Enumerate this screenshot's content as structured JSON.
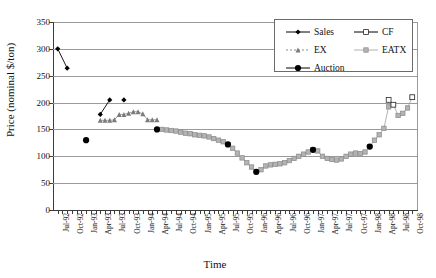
{
  "axes": {
    "ylabel": "Price (nominal $/ton)",
    "xlabel": "Time",
    "yticks": [
      "350",
      "300",
      "250",
      "200",
      "150",
      "100",
      "50",
      "0"
    ],
    "ylim": [
      0,
      350
    ],
    "xticklabels": [
      "Jul-92",
      "Oct-92",
      "Jan-93",
      "Apr-93",
      "Jul-93",
      "Oct-93",
      "Jan-94",
      "Apr-94",
      "Jul-94",
      "Oct-94",
      "Jan-95",
      "Apr-95",
      "Jul-95",
      "Oct-95",
      "Jan-96",
      "Apr-96",
      "Jul-96",
      "Oct-96",
      "Jan-97",
      "Apr-97",
      "Jul-97",
      "Oct-97",
      "Jan-98",
      "Apr-98",
      "Jul-98",
      "Oct-98"
    ],
    "grid": "horizontal"
  },
  "legend": {
    "position": "top-right",
    "entries": [
      {
        "label": "Sales",
        "marker": "diamond-filled-black",
        "line": "solid-black",
        "color": "#000000"
      },
      {
        "label": "CF",
        "marker": "square-open-black",
        "line": "solid-black",
        "color": "#000000"
      },
      {
        "label": "EX",
        "marker": "triangle-filled-gray",
        "line": "dotted-gray",
        "color": "#6e6e6e"
      },
      {
        "label": "EATX",
        "marker": "square-filled-gray",
        "line": "solid-lightgray",
        "color": "#a8a8a8"
      },
      {
        "label": "Auction",
        "marker": "circle-filled-black",
        "line": "solid-black",
        "color": "#000000"
      }
    ]
  },
  "chart_data": {
    "type": "line",
    "title": "",
    "xlabel": "Time",
    "ylabel": "Price (nominal $/ton)",
    "ylim": [
      0,
      350
    ],
    "ytick_step": 50,
    "grid": true,
    "legend_position": "top-right",
    "x_categories": [
      "Jul-92",
      "Aug-92",
      "Sep-92",
      "Oct-92",
      "Nov-92",
      "Dec-92",
      "Jan-93",
      "Feb-93",
      "Mar-93",
      "Apr-93",
      "May-93",
      "Jun-93",
      "Jul-93",
      "Aug-93",
      "Sep-93",
      "Oct-93",
      "Nov-93",
      "Dec-93",
      "Jan-94",
      "Feb-94",
      "Mar-94",
      "Apr-94",
      "May-94",
      "Jun-94",
      "Jul-94",
      "Aug-94",
      "Sep-94",
      "Oct-94",
      "Nov-94",
      "Dec-94",
      "Jan-95",
      "Feb-95",
      "Mar-95",
      "Apr-95",
      "May-95",
      "Jun-95",
      "Jul-95",
      "Aug-95",
      "Sep-95",
      "Oct-95",
      "Nov-95",
      "Dec-95",
      "Jan-96",
      "Feb-96",
      "Mar-96",
      "Apr-96",
      "May-96",
      "Jun-96",
      "Jul-96",
      "Aug-96",
      "Sep-96",
      "Oct-96",
      "Nov-96",
      "Dec-96",
      "Jan-97",
      "Feb-97",
      "Mar-97",
      "Apr-97",
      "May-97",
      "Jun-97",
      "Jul-97",
      "Aug-97",
      "Sep-97",
      "Oct-97",
      "Nov-97",
      "Dec-97",
      "Jan-98",
      "Feb-98",
      "Mar-98",
      "Apr-98",
      "May-98",
      "Jun-98",
      "Jul-98",
      "Aug-98",
      "Sep-98",
      "Oct-98"
    ],
    "series": [
      {
        "name": "Sales",
        "marker": "diamond-filled-black",
        "points": [
          {
            "x": "Jul-92",
            "y": 300
          },
          {
            "x": "Sep-92",
            "y": 264
          },
          {
            "x": "Apr-93",
            "y": 178
          },
          {
            "x": "Jun-93",
            "y": 205
          },
          {
            "x": "Sep-93",
            "y": 205
          }
        ]
      },
      {
        "name": "EX",
        "marker": "triangle-filled-gray",
        "points": [
          {
            "x": "Apr-93",
            "y": 167
          },
          {
            "x": "May-93",
            "y": 167
          },
          {
            "x": "Jun-93",
            "y": 167
          },
          {
            "x": "Jul-93",
            "y": 168
          },
          {
            "x": "Aug-93",
            "y": 178
          },
          {
            "x": "Sep-93",
            "y": 178
          },
          {
            "x": "Oct-93",
            "y": 180
          },
          {
            "x": "Nov-93",
            "y": 183
          },
          {
            "x": "Dec-93",
            "y": 183
          },
          {
            "x": "Jan-94",
            "y": 179
          },
          {
            "x": "Feb-94",
            "y": 168
          },
          {
            "x": "Mar-94",
            "y": 168
          },
          {
            "x": "Apr-94",
            "y": 168
          }
        ]
      },
      {
        "name": "EATX",
        "marker": "square-filled-gray",
        "points": [
          {
            "x": "May-94",
            "y": 150
          },
          {
            "x": "Jun-94",
            "y": 149
          },
          {
            "x": "Jul-94",
            "y": 148
          },
          {
            "x": "Aug-94",
            "y": 147
          },
          {
            "x": "Sep-94",
            "y": 145
          },
          {
            "x": "Oct-94",
            "y": 143
          },
          {
            "x": "Nov-94",
            "y": 142
          },
          {
            "x": "Dec-94",
            "y": 140
          },
          {
            "x": "Jan-95",
            "y": 139
          },
          {
            "x": "Feb-95",
            "y": 138
          },
          {
            "x": "Mar-95",
            "y": 136
          },
          {
            "x": "Apr-95",
            "y": 133
          },
          {
            "x": "May-95",
            "y": 130
          },
          {
            "x": "Jun-95",
            "y": 127
          },
          {
            "x": "Jul-95",
            "y": 122
          },
          {
            "x": "Aug-95",
            "y": 115
          },
          {
            "x": "Sep-95",
            "y": 106
          },
          {
            "x": "Oct-95",
            "y": 97
          },
          {
            "x": "Nov-95",
            "y": 88
          },
          {
            "x": "Dec-95",
            "y": 80
          },
          {
            "x": "Jan-96",
            "y": 71
          },
          {
            "x": "Feb-96",
            "y": 75
          },
          {
            "x": "Mar-96",
            "y": 82
          },
          {
            "x": "Apr-96",
            "y": 84
          },
          {
            "x": "May-96",
            "y": 85
          },
          {
            "x": "Jun-96",
            "y": 86
          },
          {
            "x": "Jul-96",
            "y": 88
          },
          {
            "x": "Aug-96",
            "y": 92
          },
          {
            "x": "Sep-96",
            "y": 96
          },
          {
            "x": "Oct-96",
            "y": 100
          },
          {
            "x": "Nov-96",
            "y": 104
          },
          {
            "x": "Dec-96",
            "y": 108
          },
          {
            "x": "Jan-97",
            "y": 112
          },
          {
            "x": "Feb-97",
            "y": 110
          },
          {
            "x": "Mar-97",
            "y": 100
          },
          {
            "x": "Apr-97",
            "y": 96
          },
          {
            "x": "May-97",
            "y": 94
          },
          {
            "x": "Jun-97",
            "y": 93
          },
          {
            "x": "Jul-97",
            "y": 95
          },
          {
            "x": "Aug-97",
            "y": 100
          },
          {
            "x": "Sep-97",
            "y": 104
          },
          {
            "x": "Oct-97",
            "y": 106
          },
          {
            "x": "Nov-97",
            "y": 105
          },
          {
            "x": "Dec-97",
            "y": 108
          },
          {
            "x": "Jan-98",
            "y": 118
          },
          {
            "x": "Feb-98",
            "y": 130
          },
          {
            "x": "Mar-98",
            "y": 140
          },
          {
            "x": "Apr-98",
            "y": 152
          },
          {
            "x": "May-98",
            "y": 192
          },
          {
            "x": "Jun-98",
            "y": 196
          },
          {
            "x": "Jul-98",
            "y": 176
          },
          {
            "x": "Aug-98",
            "y": 180
          },
          {
            "x": "Sep-98",
            "y": 190
          },
          {
            "x": "Oct-98",
            "y": 210
          }
        ]
      },
      {
        "name": "CF",
        "marker": "square-open-black",
        "points": [
          {
            "x": "May-98",
            "y": 205
          },
          {
            "x": "Jun-98",
            "y": 196
          },
          {
            "x": "Oct-98",
            "y": 210
          }
        ]
      },
      {
        "name": "Auction",
        "marker": "circle-filled-black",
        "points": [
          {
            "x": "Jan-93",
            "y": 130
          },
          {
            "x": "Apr-94",
            "y": 150
          },
          {
            "x": "Jul-95",
            "y": 122
          },
          {
            "x": "Jan-96",
            "y": 71
          },
          {
            "x": "Jan-97",
            "y": 112
          },
          {
            "x": "Jan-98",
            "y": 118
          }
        ]
      }
    ]
  }
}
